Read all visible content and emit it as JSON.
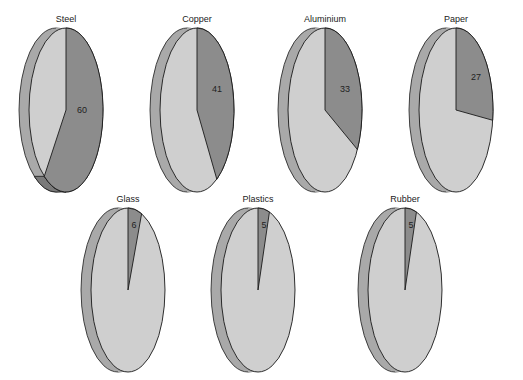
{
  "chart_data": {
    "type": "pie",
    "title": "",
    "colors": {
      "highlight_slice": "#8c8c8c",
      "remaining_slice": "#cfcfcf",
      "side_edge": "#a9a9a9",
      "side_edge_dark": "#7a7a7a",
      "outline": "#1a1a1a"
    },
    "charts": [
      {
        "label": "Steel",
        "value": 60
      },
      {
        "label": "Copper",
        "value": 41
      },
      {
        "label": "Aluminium",
        "value": 33
      },
      {
        "label": "Paper",
        "value": 27
      },
      {
        "label": "Glass",
        "value": 6
      },
      {
        "label": "Plastics",
        "value": 5
      },
      {
        "label": "Rubber",
        "value": 5
      }
    ]
  }
}
